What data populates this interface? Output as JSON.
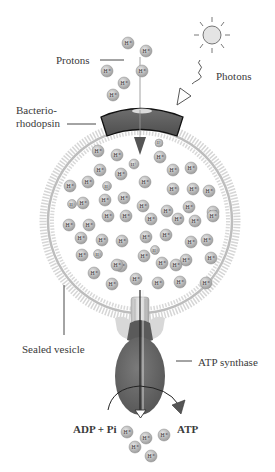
{
  "labels": {
    "protons": "Protons",
    "photons": "Photons",
    "bacteriorhodopsin_line1": "Bacterio-",
    "bacteriorhodopsin_line2": "rhodopsin",
    "sealed_vesicle": "Sealed vesicle",
    "atp_synthase": "ATP synthase",
    "adp_pi": "ADP + Pi",
    "atp": "ATP"
  },
  "proton_symbol": "H+",
  "colors": {
    "proton_fill": "#bdbdbd",
    "proton_stroke": "#8a8a8a",
    "membrane": "#c8c8c8",
    "bacteriorhodopsin": "#5e5e5e",
    "atp_synthase": "#6a6a6a",
    "arrow_dark": "#555555",
    "sun": "#e2e2e2"
  },
  "components": [
    "sun-photon-source",
    "photon-wave",
    "bacteriorhodopsin-pump",
    "sealed-vesicle-membrane",
    "atp-synthase",
    "proton-flow-arrow",
    "atp-conversion-arrow"
  ]
}
